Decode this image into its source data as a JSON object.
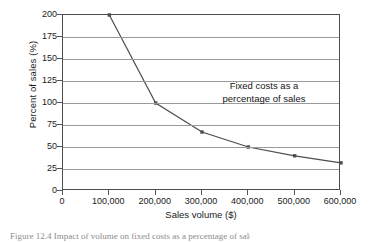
{
  "chart_data": {
    "type": "line",
    "title": "",
    "xlabel": "Sales volume ($)",
    "ylabel": "Percent of sales (%)",
    "x": [
      100000,
      200000,
      300000,
      400000,
      500000,
      600000
    ],
    "values": [
      200,
      100,
      67,
      50,
      40,
      32
    ],
    "series": [
      {
        "name": "Fixed costs as a percentage of sales",
        "x": [
          100000,
          200000,
          300000,
          400000,
          500000,
          600000
        ],
        "values": [
          200,
          100,
          67,
          50,
          40,
          32
        ]
      }
    ],
    "xlim": [
      0,
      600000
    ],
    "ylim": [
      0,
      200
    ],
    "xticks": [
      0,
      100000,
      200000,
      300000,
      400000,
      500000,
      600000
    ],
    "xtick_labels": [
      "0",
      "100,000",
      "200,000",
      "300,000",
      "400,000",
      "500,000",
      "600,000"
    ],
    "yticks": [
      0,
      25,
      50,
      75,
      100,
      125,
      150,
      175,
      200
    ],
    "ytick_labels": [
      "0",
      "25",
      "50",
      "75",
      "100",
      "125",
      "150",
      "175",
      "200"
    ],
    "grid": "horizontal",
    "legend": "none",
    "annotations": [
      {
        "text_line1": "Fixed costs as a",
        "text_line2": "percentage of sales",
        "x": 430000,
        "y": 115
      }
    ],
    "colors": {
      "line": "#4d4d4d",
      "marker": "#4d4d4d",
      "grid": "#9a9a9a",
      "axis": "#4d4d4d",
      "background": "#ffffff",
      "text": "#1a1a1a"
    }
  },
  "caption": {
    "text": "Figure 12.4   Impact of volume on fixed costs as a percentage of sales"
  }
}
